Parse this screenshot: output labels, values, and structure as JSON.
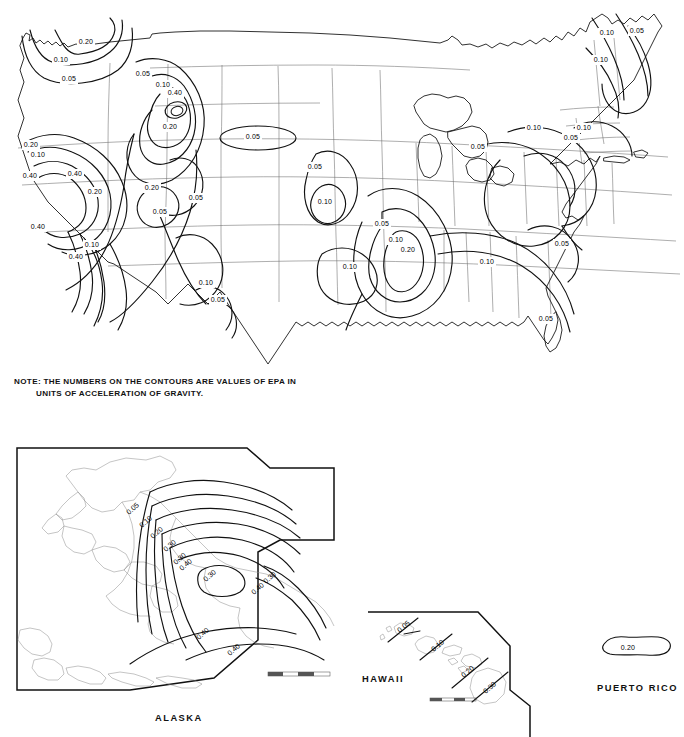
{
  "figure": {
    "kind": "seismic-hazard-contour-map",
    "note_line1": "NOTE: THE NUMBERS ON THE CONTOURS ARE VALUES OF EPA IN",
    "note_line2": "UNITS OF ACCELERATION OF GRAVITY."
  },
  "regions": {
    "alaska_label": "ALASKA",
    "hawaii_label": "HAWAII",
    "puerto_rico_label": "PUERTO RICO"
  },
  "chart_data": {
    "type": "contour-map",
    "quantity": "EPA",
    "units": "acceleration of gravity (g)",
    "contour_levels": [
      0.05,
      0.1,
      0.2,
      0.3,
      0.4
    ],
    "legend": "none",
    "grid": "state boundaries",
    "panels": [
      {
        "name": "Contiguous United States",
        "labels": [
          {
            "value": "0.20",
            "x": 86,
            "y": 42
          },
          {
            "value": "0.10",
            "x": 61,
            "y": 60
          },
          {
            "value": "0.05",
            "x": 69,
            "y": 79
          },
          {
            "value": "0.05",
            "x": 143,
            "y": 74
          },
          {
            "value": "0.10",
            "x": 163,
            "y": 85
          },
          {
            "value": "0.40",
            "x": 175,
            "y": 93
          },
          {
            "value": "0.20",
            "x": 170,
            "y": 127
          },
          {
            "value": "0.20",
            "x": 31,
            "y": 145
          },
          {
            "value": "0.10",
            "x": 38,
            "y": 155
          },
          {
            "value": "0.40",
            "x": 30,
            "y": 176
          },
          {
            "value": "0.40",
            "x": 75,
            "y": 174
          },
          {
            "value": "0.20",
            "x": 95,
            "y": 192
          },
          {
            "value": "0.20",
            "x": 152,
            "y": 188
          },
          {
            "value": "0.05",
            "x": 253,
            "y": 137
          },
          {
            "value": "0.05",
            "x": 196,
            "y": 198
          },
          {
            "value": "0.05",
            "x": 160,
            "y": 212
          },
          {
            "value": "0.40",
            "x": 38,
            "y": 227
          },
          {
            "value": "0.10",
            "x": 92,
            "y": 245
          },
          {
            "value": "0.40",
            "x": 76,
            "y": 257
          },
          {
            "value": "0.10",
            "x": 206,
            "y": 283
          },
          {
            "value": "0.05",
            "x": 218,
            "y": 300
          },
          {
            "value": "0.05",
            "x": 315,
            "y": 167
          },
          {
            "value": "0.10",
            "x": 325,
            "y": 202
          },
          {
            "value": "0.05",
            "x": 382,
            "y": 224
          },
          {
            "value": "0.10",
            "x": 396,
            "y": 240
          },
          {
            "value": "0.20",
            "x": 408,
            "y": 250
          },
          {
            "value": "0.10",
            "x": 350,
            "y": 267
          },
          {
            "value": "0.05",
            "x": 478,
            "y": 147
          },
          {
            "value": "0.10",
            "x": 534,
            "y": 128
          },
          {
            "value": "0.10",
            "x": 584,
            "y": 128
          },
          {
            "value": "0.05",
            "x": 571,
            "y": 138
          },
          {
            "value": "0.10",
            "x": 607,
            "y": 33
          },
          {
            "value": "0.05",
            "x": 637,
            "y": 31
          },
          {
            "value": "0.10",
            "x": 601,
            "y": 60
          },
          {
            "value": "0.10",
            "x": 487,
            "y": 262
          },
          {
            "value": "0.05",
            "x": 562,
            "y": 244
          },
          {
            "value": "0.05",
            "x": 546,
            "y": 319
          }
        ]
      },
      {
        "name": "Alaska",
        "labels": [
          {
            "value": "0.05",
            "x": 133,
            "y": 509
          },
          {
            "value": "0.10",
            "x": 146,
            "y": 522
          },
          {
            "value": "0.20",
            "x": 157,
            "y": 533
          },
          {
            "value": "0.30",
            "x": 170,
            "y": 546
          },
          {
            "value": "0.30",
            "x": 180,
            "y": 559
          },
          {
            "value": "0.40",
            "x": 186,
            "y": 565
          },
          {
            "value": "0.30",
            "x": 210,
            "y": 576
          },
          {
            "value": "0.30",
            "x": 270,
            "y": 578
          },
          {
            "value": "0.40",
            "x": 258,
            "y": 589
          },
          {
            "value": "0.40",
            "x": 203,
            "y": 634
          },
          {
            "value": "0.40",
            "x": 234,
            "y": 650
          }
        ]
      },
      {
        "name": "Hawaii",
        "labels": [
          {
            "value": "0.05",
            "x": 404,
            "y": 627
          },
          {
            "value": "0.10",
            "x": 438,
            "y": 646
          },
          {
            "value": "0.20",
            "x": 468,
            "y": 672
          },
          {
            "value": "0.30",
            "x": 490,
            "y": 688
          }
        ]
      },
      {
        "name": "Puerto Rico",
        "labels": [
          {
            "value": "0.20",
            "x": 628,
            "y": 648
          }
        ]
      }
    ]
  }
}
